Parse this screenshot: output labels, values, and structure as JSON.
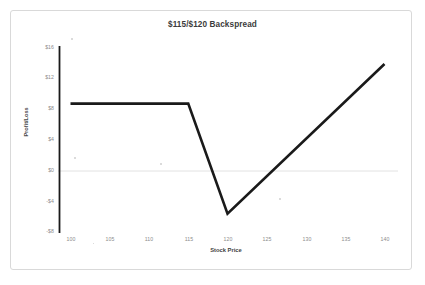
{
  "chart_data": {
    "type": "line",
    "title": "$115/$120 Backspread",
    "xlabel": "Stock Price",
    "ylabel": "Profit/Loss",
    "xlim": [
      98,
      142
    ],
    "ylim": [
      -8,
      16
    ],
    "grid": false,
    "zero_line": true,
    "legend": "none",
    "x_ticks": [
      "100",
      "105",
      "110",
      "115",
      "120",
      "125",
      "130",
      "135",
      "140"
    ],
    "x_tick_values": [
      100,
      105,
      110,
      115,
      120,
      125,
      130,
      135,
      140
    ],
    "y_ticks": [
      "$16",
      "$12",
      "$8",
      "$4",
      "$0",
      "-$4",
      "-$8"
    ],
    "y_tick_values": [
      16,
      12,
      8,
      4,
      0,
      -4,
      -8
    ],
    "series": [
      {
        "name": "Profit/Loss",
        "color": "#1a1a1a",
        "x": [
          100,
          115,
          120,
          140
        ],
        "values": [
          8.7,
          8.7,
          -5.5,
          13.8
        ]
      }
    ],
    "line_color": "#1a1a1a",
    "line_width": 2.6,
    "axis_color": "#1a1a1a",
    "zero_line_color": "#e2e2e2",
    "frame_color": "#d9d9d9",
    "background_color": "#ffffff",
    "tick_label_color": "#8c8c8c"
  }
}
